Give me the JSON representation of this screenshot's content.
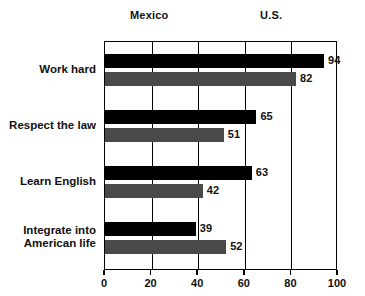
{
  "chart_data": {
    "type": "bar",
    "orientation": "horizontal",
    "title": "",
    "xlabel": "",
    "ylabel": "",
    "xlim": [
      0,
      100
    ],
    "xticks": [
      0,
      20,
      40,
      60,
      80,
      100
    ],
    "grid": true,
    "legend_position": "top",
    "categories": [
      "Work hard",
      "Respect the law",
      "Learn English",
      "Integrate into\nAmerican life"
    ],
    "series": [
      {
        "name": "Mexico",
        "color": "#000000",
        "values": [
          94,
          65,
          63,
          39
        ]
      },
      {
        "name": "U.S.",
        "color": "#4a4a4a",
        "values": [
          82,
          51,
          42,
          52
        ]
      }
    ]
  },
  "legend": {
    "entries": [
      {
        "label": "Mexico",
        "swatch": "legend-swatch-black"
      },
      {
        "label": "U.S.",
        "swatch": "legend-swatch-gray"
      }
    ]
  },
  "axis": {
    "tick_labels": [
      "0",
      "20",
      "40",
      "60",
      "80",
      "100"
    ]
  },
  "value_labels": {
    "work_hard_mexico": "94",
    "work_hard_us": "82",
    "respect_law_mexico": "65",
    "respect_law_us": "51",
    "learn_english_mexico": "63",
    "learn_english_us": "42",
    "integrate_mexico": "39",
    "integrate_us": "52"
  },
  "colors": {
    "mexico": "#000000",
    "us": "#4a4a4a",
    "axis": "#000000",
    "background": "#ffffff"
  }
}
